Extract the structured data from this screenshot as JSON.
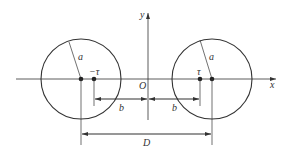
{
  "diagram": {
    "type": "two-cylinder line charge image diagram",
    "axes": {
      "x_label": "x",
      "y_label": "y",
      "origin_label": "O"
    },
    "left_circle": {
      "radius_label": "a",
      "charge_label": "−τ"
    },
    "right_circle": {
      "radius_label": "a",
      "charge_label": "τ"
    },
    "dimensions": {
      "left_b_label": "b",
      "right_b_label": "b",
      "D_label": "D"
    },
    "colors": {
      "line": "#333333",
      "background": "#ffffff"
    }
  }
}
